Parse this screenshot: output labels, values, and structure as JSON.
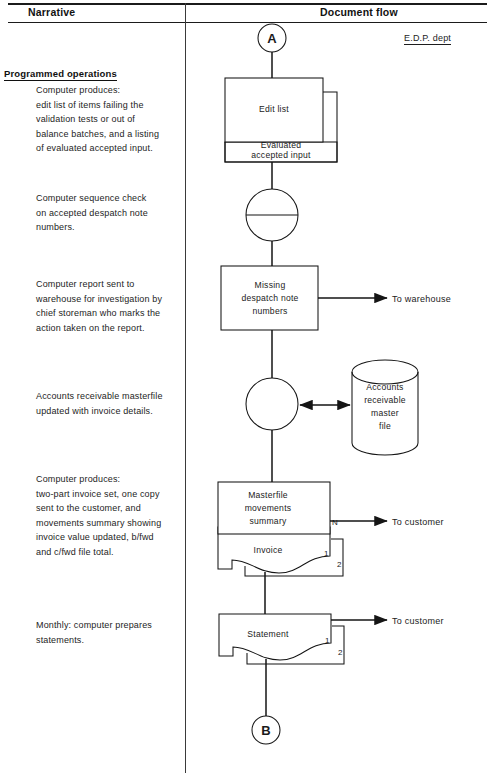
{
  "header": {
    "narrative_label": "Narrative",
    "document_flow_label": "Document flow",
    "dept_label": "E.D.P. dept"
  },
  "narrative": {
    "section_title": "Programmed operations",
    "blocks": [
      {
        "id": "edit-list-narrative",
        "lines": [
          "Computer produces:",
          "edit list of items failing the",
          "validation tests or out of",
          "balance batches, and a listing",
          "of evaluated accepted input."
        ]
      },
      {
        "id": "sequence-check-narrative",
        "lines": [
          "Computer sequence check",
          "on accepted despatch note",
          "numbers."
        ]
      },
      {
        "id": "warehouse-report-narrative",
        "lines": [
          "Computer report sent to",
          "warehouse for investigation by",
          "chief storeman who marks the",
          "action taken on the report."
        ]
      },
      {
        "id": "masterfile-update-narrative",
        "lines": [
          "Accounts receivable masterfile",
          "updated with invoice details."
        ]
      },
      {
        "id": "invoice-narrative",
        "lines": [
          "Computer produces:",
          "two-part invoice set, one copy",
          "sent to the customer, and",
          "movements summary showing",
          "invoice value updated, b/fwd",
          "and c/fwd file total."
        ]
      },
      {
        "id": "statement-narrative",
        "lines": [
          "Monthly: computer prepares",
          "statements."
        ]
      }
    ]
  },
  "flow": {
    "connector_top": "A",
    "connector_bottom": "B",
    "nodes": {
      "edit_list": "Edit list",
      "evaluated_input_line1": "Evaluated",
      "evaluated_input_line2": "accepted input",
      "missing_line1": "Missing",
      "missing_line2": "despatch  note",
      "missing_line3": "numbers",
      "masterfile_line1": "Accounts",
      "masterfile_line2": "receivable",
      "masterfile_line3": "master",
      "masterfile_line4": "file",
      "movements_line1": "Masterfile",
      "movements_line2": "movements",
      "movements_line3": "summary",
      "invoice": "Invoice",
      "statement": "Statement"
    },
    "destinations": {
      "to_warehouse": "To warehouse",
      "to_customer_invoice": "To customer",
      "to_customer_statement": "To customer"
    },
    "part_labels": {
      "movements_copies": "N",
      "invoice_copy_1": "1",
      "invoice_copy_2": "2",
      "statement_copy_1": "1",
      "statement_copy_2": "2"
    }
  },
  "colors": {
    "ink": "#151515",
    "paper": "#ffffff"
  }
}
